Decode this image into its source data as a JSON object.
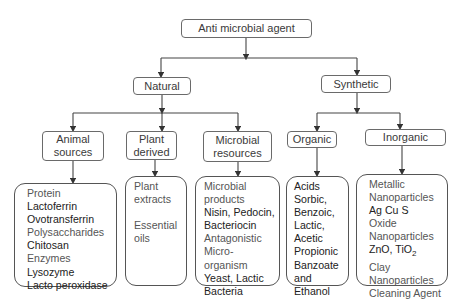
{
  "diagram": {
    "root": {
      "label": "Anti microbial agent"
    },
    "level1": [
      {
        "id": "natural",
        "label": "Natural"
      },
      {
        "id": "synthetic",
        "label": "Synthetic"
      }
    ],
    "level2": [
      {
        "id": "animal",
        "parent": "natural",
        "label_line1": "Animal",
        "label_line2": "sources"
      },
      {
        "id": "plant",
        "parent": "natural",
        "label_line1": "Plant",
        "label_line2": "derived"
      },
      {
        "id": "microbial",
        "parent": "natural",
        "label_line1": "Microbial",
        "label_line2": "resources"
      },
      {
        "id": "organic",
        "parent": "synthetic",
        "label_line1": "Organic",
        "label_line2": ""
      },
      {
        "id": "inorganic",
        "parent": "synthetic",
        "label_line1": "Inorganic",
        "label_line2": ""
      }
    ],
    "leaves": {
      "animal": [
        "Protein",
        "Lactoferrin",
        "Ovotransferrin",
        "Polysaccharides",
        "Chitosan",
        "Enzymes",
        "Lysozyme",
        "Lacto peroxidase"
      ],
      "plant": [
        "Plant",
        "extracts",
        "",
        "Essential",
        "oils"
      ],
      "microbial": [
        "Microbial",
        "products",
        "Nisin, Pedocin,",
        "Bacteriocin",
        "Antagonistic",
        "Micro-",
        "organism",
        "Yeast, Lactic",
        "Bacteria"
      ],
      "organic": [
        "Acids",
        "Sorbic,",
        "Benzoic,",
        "Lactic,",
        "Acetic",
        "Propionic",
        "Banzoate",
        "and",
        "Ethanol"
      ],
      "inorganic": [
        "Metallic",
        "Nanoparticles",
        "Ag Cu S",
        "Oxide",
        "Nanoparticles",
        "ZnO, TiO",
        "Clay",
        "Nanoparticles",
        "Cleaning Agent"
      ],
      "inorganic_subscript": "2"
    }
  }
}
